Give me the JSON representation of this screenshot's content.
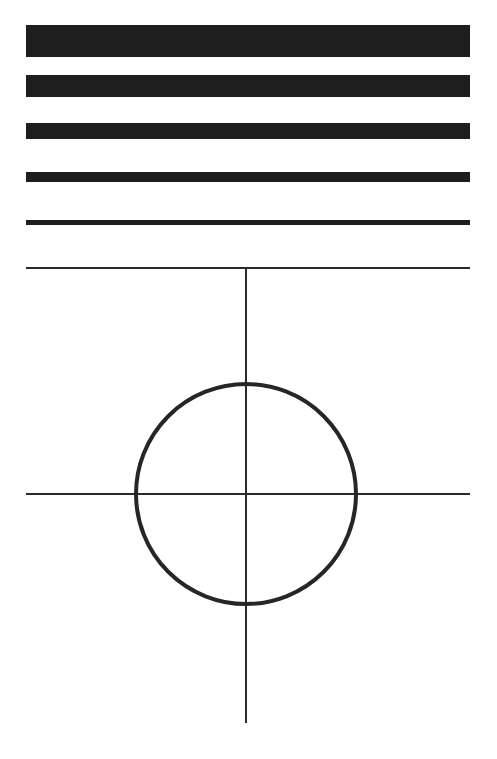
{
  "diagram": {
    "title": "",
    "colors": {
      "background": "#ffffff",
      "ink": "#1e1e1e",
      "line": "#2a2a2a"
    },
    "bars": [
      {
        "label": "bar-1",
        "x": 26,
        "y": 25,
        "width": 444,
        "height": 32
      },
      {
        "label": "bar-2",
        "x": 26,
        "y": 75,
        "width": 444,
        "height": 22
      },
      {
        "label": "bar-3",
        "x": 26,
        "y": 123,
        "width": 444,
        "height": 16
      },
      {
        "label": "bar-4",
        "x": 26,
        "y": 172,
        "width": 444,
        "height": 10
      },
      {
        "label": "bar-5",
        "x": 26,
        "y": 220,
        "width": 444,
        "height": 5
      }
    ],
    "crosshair": {
      "top_line": {
        "x1": 26,
        "x2": 470,
        "y": 268
      },
      "vertical_line": {
        "x": 246,
        "y1": 268,
        "y2": 723
      },
      "horizontal_line": {
        "x1": 26,
        "x2": 470,
        "y": 494
      },
      "circle": {
        "cx": 246,
        "cy": 494,
        "r": 110,
        "stroke_width": 4
      }
    }
  }
}
